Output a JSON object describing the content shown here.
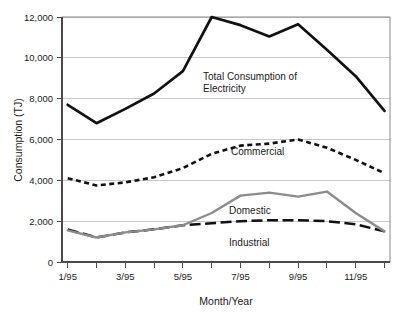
{
  "chart_data": {
    "type": "line",
    "title": "",
    "xlabel": "Month/Year",
    "ylabel": "Consumption (TJ)",
    "ylim": [
      0,
      12000
    ],
    "ytick_labels": [
      "0",
      "2,000",
      "4,000",
      "6,000",
      "8,000",
      "10,000",
      "12,000"
    ],
    "ytick_values": [
      0,
      2000,
      4000,
      6000,
      8000,
      10000,
      12000
    ],
    "grid": "horizontal",
    "legend_position": "inline-annotations",
    "x": [
      1,
      2,
      3,
      4,
      5,
      6,
      7,
      8,
      9,
      10,
      11,
      12
    ],
    "categories": [
      "1/95",
      "2/95",
      "3/95",
      "4/95",
      "5/95",
      "6/95",
      "7/95",
      "8/95",
      "9/95",
      "10/95",
      "11/95",
      "12/95"
    ],
    "xtick_labels": [
      "1/95",
      "",
      "3/95",
      "",
      "5/95",
      "",
      "7/95",
      "",
      "9/95",
      "",
      "11/95",
      ""
    ],
    "xtick_labels_shown": [
      "1/95",
      "3/95",
      "5/95",
      "7/95",
      "9/95",
      "11/95"
    ],
    "series": [
      {
        "name": "Total Consumption of Electricity",
        "label_line1": "Total Consumption of",
        "label_line2": "Electricity",
        "style": "solid",
        "color": "#111111",
        "values": [
          7700,
          6800,
          7500,
          8250,
          9350,
          12000,
          11600,
          11050,
          11650,
          10400,
          9100,
          7400
        ]
      },
      {
        "name": "Commercial",
        "label_line1": "Commercial",
        "label_line2": "",
        "style": "dotted",
        "color": "#111111",
        "values": [
          4100,
          3750,
          3900,
          4150,
          4600,
          5300,
          5700,
          5800,
          6000,
          5600,
          5000,
          4350
        ]
      },
      {
        "name": "Domestic",
        "label_line1": "Domestic",
        "label_line2": "",
        "style": "solid",
        "color": "#8c8c8c",
        "values": [
          1550,
          1200,
          1450,
          1600,
          1800,
          2400,
          3250,
          3400,
          3200,
          3450,
          2400,
          1500
        ]
      },
      {
        "name": "Industrial",
        "label_line1": "Industrial",
        "label_line2": "",
        "style": "dashed",
        "color": "#111111",
        "values": [
          1600,
          1200,
          1450,
          1600,
          1800,
          1900,
          2000,
          2050,
          2050,
          2000,
          1850,
          1500
        ]
      }
    ]
  },
  "axes": {
    "y_title": "Consumption (TJ)",
    "x_title": "Month/Year"
  }
}
